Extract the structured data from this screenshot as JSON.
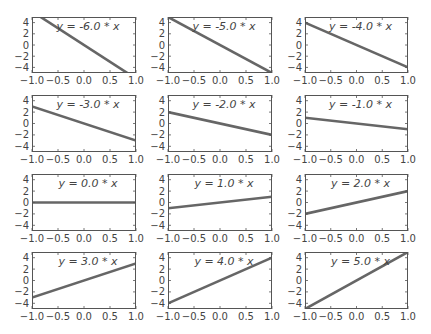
{
  "figure": {
    "width": 431,
    "height": 334,
    "layout": {
      "rows": 4,
      "cols": 3
    },
    "colors": {
      "line": "#666666",
      "frame": "#555555",
      "text": "#444444",
      "background": "#ffffff"
    }
  },
  "chart_data": [
    {
      "type": "line",
      "title": "",
      "annotation": "y = -6.0 * x",
      "slope": -6.0,
      "x": [
        -1.0,
        1.0
      ],
      "y": [
        6.0,
        -6.0
      ],
      "xlim": [
        -1.0,
        1.0
      ],
      "ylim": [
        -5,
        5
      ],
      "xticks": [
        "−1.0",
        "−0.5",
        "0.0",
        "0.5",
        "1.0"
      ],
      "yticks": [
        "4",
        "2",
        "0",
        "−2",
        "−4"
      ],
      "grid": false
    },
    {
      "type": "line",
      "title": "",
      "annotation": "y = -5.0 * x",
      "slope": -5.0,
      "x": [
        -1.0,
        1.0
      ],
      "y": [
        5.0,
        -5.0
      ],
      "xlim": [
        -1.0,
        1.0
      ],
      "ylim": [
        -5,
        5
      ],
      "xticks": [
        "−1.0",
        "−0.5",
        "0.0",
        "0.5",
        "1.0"
      ],
      "yticks": [
        "4",
        "2",
        "0",
        "−2",
        "−4"
      ],
      "grid": false
    },
    {
      "type": "line",
      "title": "",
      "annotation": "y = -4.0 * x",
      "slope": -4.0,
      "x": [
        -1.0,
        1.0
      ],
      "y": [
        4.0,
        -4.0
      ],
      "xlim": [
        -1.0,
        1.0
      ],
      "ylim": [
        -5,
        5
      ],
      "xticks": [
        "−1.0",
        "−0.5",
        "0.0",
        "0.5",
        "1.0"
      ],
      "yticks": [
        "4",
        "2",
        "0",
        "−2",
        "−4"
      ],
      "grid": false
    },
    {
      "type": "line",
      "title": "",
      "annotation": "y = -3.0 * x",
      "slope": -3.0,
      "x": [
        -1.0,
        1.0
      ],
      "y": [
        3.0,
        -3.0
      ],
      "xlim": [
        -1.0,
        1.0
      ],
      "ylim": [
        -5,
        5
      ],
      "xticks": [
        "−1.0",
        "−0.5",
        "0.0",
        "0.5",
        "1.0"
      ],
      "yticks": [
        "4",
        "2",
        "0",
        "−2",
        "−4"
      ],
      "grid": false
    },
    {
      "type": "line",
      "title": "",
      "annotation": "y = -2.0 * x",
      "slope": -2.0,
      "x": [
        -1.0,
        1.0
      ],
      "y": [
        2.0,
        -2.0
      ],
      "xlim": [
        -1.0,
        1.0
      ],
      "ylim": [
        -5,
        5
      ],
      "xticks": [
        "−1.0",
        "−0.5",
        "0.0",
        "0.5",
        "1.0"
      ],
      "yticks": [
        "4",
        "2",
        "0",
        "−2",
        "−4"
      ],
      "grid": false
    },
    {
      "type": "line",
      "title": "",
      "annotation": "y = -1.0 * x",
      "slope": -1.0,
      "x": [
        -1.0,
        1.0
      ],
      "y": [
        1.0,
        -1.0
      ],
      "xlim": [
        -1.0,
        1.0
      ],
      "ylim": [
        -5,
        5
      ],
      "xticks": [
        "−1.0",
        "−0.5",
        "0.0",
        "0.5",
        "1.0"
      ],
      "yticks": [
        "4",
        "2",
        "0",
        "−2",
        "−4"
      ],
      "grid": false
    },
    {
      "type": "line",
      "title": "",
      "annotation": "y = 0.0 * x",
      "slope": 0.0,
      "x": [
        -1.0,
        1.0
      ],
      "y": [
        0.0,
        0.0
      ],
      "xlim": [
        -1.0,
        1.0
      ],
      "ylim": [
        -5,
        5
      ],
      "xticks": [
        "−1.0",
        "−0.5",
        "0.0",
        "0.5",
        "1.0"
      ],
      "yticks": [
        "4",
        "2",
        "0",
        "−2",
        "−4"
      ],
      "grid": false
    },
    {
      "type": "line",
      "title": "",
      "annotation": "y = 1.0 * x",
      "slope": 1.0,
      "x": [
        -1.0,
        1.0
      ],
      "y": [
        -1.0,
        1.0
      ],
      "xlim": [
        -1.0,
        1.0
      ],
      "ylim": [
        -5,
        5
      ],
      "xticks": [
        "−1.0",
        "−0.5",
        "0.0",
        "0.5",
        "1.0"
      ],
      "yticks": [
        "4",
        "2",
        "0",
        "−2",
        "−4"
      ],
      "grid": false
    },
    {
      "type": "line",
      "title": "",
      "annotation": "y = 2.0 * x",
      "slope": 2.0,
      "x": [
        -1.0,
        1.0
      ],
      "y": [
        -2.0,
        2.0
      ],
      "xlim": [
        -1.0,
        1.0
      ],
      "ylim": [
        -5,
        5
      ],
      "xticks": [
        "−1.0",
        "−0.5",
        "0.0",
        "0.5",
        "1.0"
      ],
      "yticks": [
        "4",
        "2",
        "0",
        "−2",
        "−4"
      ],
      "grid": false
    },
    {
      "type": "line",
      "title": "",
      "annotation": "y = 3.0 * x",
      "slope": 3.0,
      "x": [
        -1.0,
        1.0
      ],
      "y": [
        -3.0,
        3.0
      ],
      "xlim": [
        -1.0,
        1.0
      ],
      "ylim": [
        -5,
        5
      ],
      "xticks": [
        "−1.0",
        "−0.5",
        "0.0",
        "0.5",
        "1.0"
      ],
      "yticks": [
        "4",
        "2",
        "0",
        "−2",
        "−4"
      ],
      "grid": false
    },
    {
      "type": "line",
      "title": "",
      "annotation": "y = 4.0 * x",
      "slope": 4.0,
      "x": [
        -1.0,
        1.0
      ],
      "y": [
        -4.0,
        4.0
      ],
      "xlim": [
        -1.0,
        1.0
      ],
      "ylim": [
        -5,
        5
      ],
      "xticks": [
        "−1.0",
        "−0.5",
        "0.0",
        "0.5",
        "1.0"
      ],
      "yticks": [
        "4",
        "2",
        "0",
        "−2",
        "−4"
      ],
      "grid": false
    },
    {
      "type": "line",
      "title": "",
      "annotation": "y = 5.0 * x",
      "slope": 5.0,
      "x": [
        -1.0,
        1.0
      ],
      "y": [
        -5.0,
        5.0
      ],
      "xlim": [
        -1.0,
        1.0
      ],
      "ylim": [
        -5,
        5
      ],
      "xticks": [
        "−1.0",
        "−0.5",
        "0.0",
        "0.5",
        "1.0"
      ],
      "yticks": [
        "4",
        "2",
        "0",
        "−2",
        "−4"
      ],
      "grid": false
    }
  ]
}
